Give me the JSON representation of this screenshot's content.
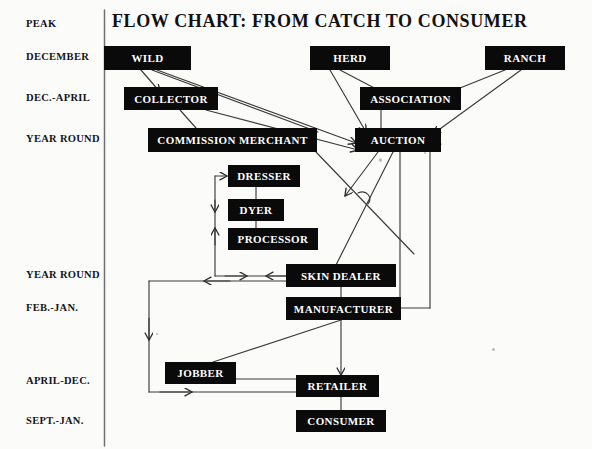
{
  "title": "FLOW CHART:  FROM  CATCH  TO  CONSUMER",
  "colors": {
    "box_fill": "#0a0a0a",
    "box_text": "#ffffff",
    "line": "#333333",
    "page_background": "#fbfbfa",
    "label_text": "#151515"
  },
  "stage_labels": [
    {
      "id": "peak",
      "text": "PEAK",
      "x": 26,
      "y": 18
    },
    {
      "id": "december",
      "text": "DECEMBER",
      "x": 26,
      "y": 51
    },
    {
      "id": "dec-april",
      "text": "DEC.-APRIL",
      "x": 26,
      "y": 92
    },
    {
      "id": "year-round-top",
      "text": "YEAR ROUND",
      "x": 26,
      "y": 133
    },
    {
      "id": "year-round-bottom",
      "text": "YEAR ROUND",
      "x": 26,
      "y": 269
    },
    {
      "id": "feb-jan",
      "text": "FEB.-JAN.",
      "x": 26,
      "y": 302
    },
    {
      "id": "april-dec",
      "text": "APRIL-DEC.",
      "x": 26,
      "y": 375
    },
    {
      "id": "sept-jan",
      "text": "SEPT.-JAN.",
      "x": 26,
      "y": 415
    }
  ],
  "nodes": [
    {
      "id": "wild",
      "label": "WILD",
      "x": 104,
      "y": 46,
      "w": 87,
      "h": 24
    },
    {
      "id": "herd",
      "label": "HERD",
      "x": 310,
      "y": 46,
      "w": 80,
      "h": 24
    },
    {
      "id": "ranch",
      "label": "RANCH",
      "x": 485,
      "y": 46,
      "w": 80,
      "h": 24
    },
    {
      "id": "collector",
      "label": "COLLECTOR",
      "x": 124,
      "y": 87,
      "w": 94,
      "h": 23
    },
    {
      "id": "association",
      "label": "ASSOCIATION",
      "x": 360,
      "y": 87,
      "w": 101,
      "h": 23
    },
    {
      "id": "commission-merchant",
      "label": "COMMISSION MERCHANT",
      "x": 148,
      "y": 128,
      "w": 169,
      "h": 24
    },
    {
      "id": "auction",
      "label": "AUCTION",
      "x": 355,
      "y": 128,
      "w": 86,
      "h": 24
    },
    {
      "id": "dresser",
      "label": "DRESSER",
      "x": 228,
      "y": 165,
      "w": 72,
      "h": 22
    },
    {
      "id": "dyer",
      "label": "DYER",
      "x": 228,
      "y": 199,
      "w": 56,
      "h": 22
    },
    {
      "id": "processor",
      "label": "PROCESSOR",
      "x": 228,
      "y": 228,
      "w": 90,
      "h": 22
    },
    {
      "id": "skin-dealer",
      "label": "SKIN DEALER",
      "x": 286,
      "y": 264,
      "w": 110,
      "h": 23
    },
    {
      "id": "manufacturer",
      "label": "MANUFACTURER",
      "x": 286,
      "y": 297,
      "w": 115,
      "h": 23
    },
    {
      "id": "jobber",
      "label": "JOBBER",
      "x": 165,
      "y": 362,
      "w": 71,
      "h": 22
    },
    {
      "id": "retailer",
      "label": "RETAILER",
      "x": 296,
      "y": 375,
      "w": 83,
      "h": 22
    },
    {
      "id": "consumer",
      "label": "CONSUMER",
      "x": 296,
      "y": 410,
      "w": 90,
      "h": 22
    }
  ],
  "divider": {
    "x": 104,
    "y1": 10,
    "y2": 446
  },
  "flows": [
    {
      "from": "wild",
      "to": "collector"
    },
    {
      "from": "wild",
      "to": "commission-merchant"
    },
    {
      "from": "wild",
      "to": "auction"
    },
    {
      "from": "collector",
      "to": "commission-merchant"
    },
    {
      "from": "collector",
      "to": "auction"
    },
    {
      "from": "herd",
      "to": "association"
    },
    {
      "from": "herd",
      "to": "auction"
    },
    {
      "from": "ranch",
      "to": "association"
    },
    {
      "from": "ranch",
      "to": "auction"
    },
    {
      "from": "association",
      "to": "auction"
    },
    {
      "from": "commission-merchant",
      "to": "skin-dealer"
    },
    {
      "from": "auction",
      "to": "skin-dealer"
    },
    {
      "from": "auction",
      "to": "manufacturer"
    },
    {
      "from": "skin-dealer",
      "to": "dresser"
    },
    {
      "from": "dresser",
      "to": "dyer"
    },
    {
      "from": "dyer",
      "to": "processor"
    },
    {
      "from": "processor",
      "to": "skin-dealer"
    },
    {
      "from": "skin-dealer",
      "to": "manufacturer"
    },
    {
      "from": "manufacturer",
      "to": "jobber"
    },
    {
      "from": "manufacturer",
      "to": "retailer"
    },
    {
      "from": "manufacturer",
      "to": "auction"
    },
    {
      "from": "jobber",
      "to": "retailer"
    },
    {
      "from": "skin-dealer",
      "to": "retailer"
    },
    {
      "from": "retailer",
      "to": "consumer"
    }
  ]
}
